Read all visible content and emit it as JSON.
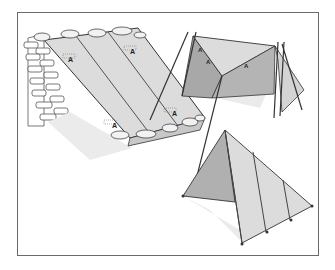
{
  "figure": {
    "panels": [
      {
        "name": "lean-to against brick wall",
        "markings": [
          "A",
          "A",
          "A",
          "A"
        ]
      },
      {
        "name": "a-frame tarp tent on poles",
        "markings": [
          "A",
          "A",
          "A"
        ]
      },
      {
        "name": "triangular pyramid tent",
        "markings": []
      }
    ],
    "colors": {
      "frame": "#6a6a6a",
      "tarp_light": "#dcdcdc",
      "tarp_mid": "#c4c4c4",
      "tarp_dark": "#a8a8a8",
      "shadow": "#ebebeb",
      "line": "#333333"
    }
  }
}
